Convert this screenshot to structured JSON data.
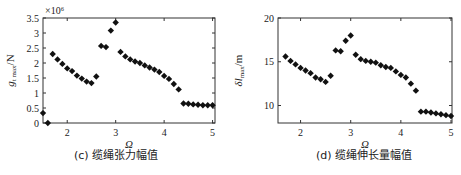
{
  "chart_data": [
    {
      "type": "scatter",
      "panel": "c",
      "title": "",
      "caption": "(c) 缆绳张力幅值",
      "xlabel": "Ω",
      "ylabel": "g_t max/N",
      "ylabel_parts": {
        "main": "g",
        "sub": "t max",
        "unit": "/N"
      },
      "y_multiplier": "×10⁶",
      "xlim": [
        1.5,
        5.05
      ],
      "ylim": [
        0,
        3.5
      ],
      "xticks": [
        2,
        3,
        4,
        5
      ],
      "yticks": [
        0,
        0.5,
        1,
        1.5,
        2,
        2.5,
        3,
        3.5
      ],
      "ytick_labels": [
        "0",
        "0.5",
        "1",
        "1.5",
        "2",
        "2.5",
        "3",
        "3.5"
      ],
      "grid": false,
      "marker": "diamond",
      "x": [
        1.5,
        1.6,
        1.7,
        1.8,
        1.9,
        2.0,
        2.1,
        2.2,
        2.3,
        2.4,
        2.5,
        2.6,
        2.7,
        2.8,
        2.9,
        3.0,
        3.1,
        3.2,
        3.3,
        3.4,
        3.5,
        3.6,
        3.7,
        3.8,
        3.9,
        4.0,
        4.1,
        4.2,
        4.3,
        4.4,
        4.5,
        4.6,
        4.7,
        4.8,
        4.9,
        5.0
      ],
      "values": [
        0.33,
        0.0,
        2.3,
        2.12,
        1.97,
        1.82,
        1.73,
        1.58,
        1.48,
        1.38,
        1.33,
        1.55,
        2.57,
        2.53,
        3.08,
        3.35,
        2.37,
        2.22,
        2.12,
        2.05,
        2.0,
        1.92,
        1.85,
        1.78,
        1.7,
        1.57,
        1.47,
        1.3,
        1.12,
        0.65,
        0.64,
        0.62,
        0.61,
        0.59,
        0.59,
        0.59
      ]
    },
    {
      "type": "scatter",
      "panel": "d",
      "title": "",
      "caption": "(d) 缆绳伸长量幅值",
      "xlabel": "Ω",
      "ylabel": "δl_max/m",
      "ylabel_parts": {
        "main": "δl",
        "sub": "max",
        "unit": "/m"
      },
      "xlim": [
        1.55,
        5.02
      ],
      "ylim": [
        8,
        20
      ],
      "xticks": [
        2,
        3,
        4,
        5
      ],
      "yticks": [
        10,
        15,
        20
      ],
      "ytick_labels": [
        "10",
        "15",
        "20"
      ],
      "grid": false,
      "marker": "diamond",
      "x": [
        1.7,
        1.8,
        1.9,
        2.0,
        2.1,
        2.2,
        2.3,
        2.4,
        2.5,
        2.6,
        2.7,
        2.8,
        2.9,
        3.0,
        3.1,
        3.2,
        3.3,
        3.4,
        3.5,
        3.6,
        3.7,
        3.8,
        3.9,
        4.0,
        4.1,
        4.2,
        4.3,
        4.4,
        4.5,
        4.6,
        4.7,
        4.8,
        4.9,
        5.0
      ],
      "values": [
        15.6,
        15.1,
        14.7,
        14.3,
        14.0,
        13.7,
        13.2,
        13.0,
        12.7,
        13.4,
        16.3,
        16.2,
        17.4,
        18.0,
        15.8,
        15.3,
        15.1,
        15.0,
        14.9,
        14.6,
        14.4,
        14.3,
        13.9,
        13.5,
        13.2,
        12.5,
        11.7,
        9.3,
        9.3,
        9.2,
        9.1,
        9.0,
        8.9,
        8.8
      ]
    }
  ],
  "style": {
    "marker_color": "#111111",
    "axis_color": "#333333"
  }
}
